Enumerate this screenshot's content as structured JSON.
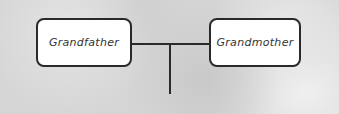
{
  "diagram": {
    "type": "family-tree",
    "nodes": [
      {
        "id": "grandfather",
        "label": "Grandfather"
      },
      {
        "id": "grandmother",
        "label": "Grandmother"
      }
    ],
    "edges": [
      {
        "from": "grandfather",
        "to": "grandmother",
        "kind": "marriage"
      },
      {
        "from": "marriage",
        "to": "child",
        "kind": "descent"
      }
    ],
    "colors": {
      "box_border": "#2a2a2a",
      "box_fill": "#ffffff",
      "line": "#2a2a2a",
      "background": "#d5d5d5"
    }
  }
}
